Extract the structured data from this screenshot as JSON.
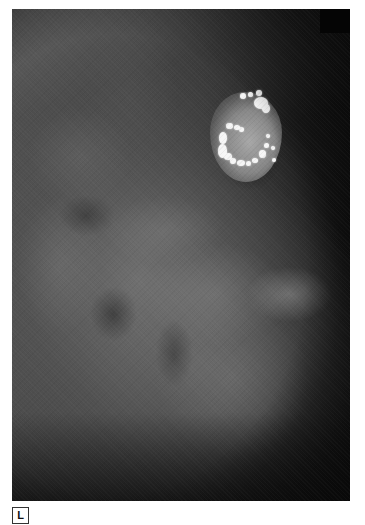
{
  "figure": {
    "type": "mammogram",
    "laterality_label": "L",
    "colors": {
      "background": "#ffffff",
      "film_dark": "#161616",
      "calcification": "#f6f6f6",
      "label_border": "#333333"
    },
    "calcifications": [
      {
        "x": 240,
        "y": 93,
        "w": 6,
        "h": 6
      },
      {
        "x": 248,
        "y": 92,
        "w": 5,
        "h": 5
      },
      {
        "x": 256,
        "y": 90,
        "w": 6,
        "h": 6
      },
      {
        "x": 254,
        "y": 97,
        "w": 14,
        "h": 12
      },
      {
        "x": 262,
        "y": 104,
        "w": 8,
        "h": 9
      },
      {
        "x": 226,
        "y": 123,
        "w": 7,
        "h": 6
      },
      {
        "x": 234,
        "y": 125,
        "w": 6,
        "h": 5
      },
      {
        "x": 239,
        "y": 127,
        "w": 5,
        "h": 5
      },
      {
        "x": 219,
        "y": 132,
        "w": 8,
        "h": 12
      },
      {
        "x": 218,
        "y": 144,
        "w": 9,
        "h": 14
      },
      {
        "x": 224,
        "y": 153,
        "w": 8,
        "h": 7
      },
      {
        "x": 230,
        "y": 158,
        "w": 6,
        "h": 6
      },
      {
        "x": 237,
        "y": 160,
        "w": 8,
        "h": 6
      },
      {
        "x": 246,
        "y": 161,
        "w": 5,
        "h": 5
      },
      {
        "x": 252,
        "y": 158,
        "w": 6,
        "h": 5
      },
      {
        "x": 259,
        "y": 150,
        "w": 7,
        "h": 8
      },
      {
        "x": 264,
        "y": 143,
        "w": 5,
        "h": 5
      },
      {
        "x": 266,
        "y": 134,
        "w": 4,
        "h": 4
      },
      {
        "x": 271,
        "y": 146,
        "w": 4,
        "h": 4
      },
      {
        "x": 272,
        "y": 158,
        "w": 4,
        "h": 4
      }
    ]
  }
}
